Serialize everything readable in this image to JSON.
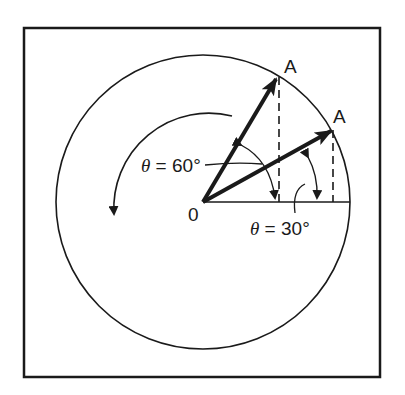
{
  "figure": {
    "origin_label": "0",
    "point_label_upper": "A",
    "point_label_lower": "A",
    "angle_label_60": {
      "symbol": "θ",
      "text": " = 60°"
    },
    "angle_label_30": {
      "symbol": "θ",
      "text": " = 30°"
    },
    "angles_deg": [
      60,
      30
    ],
    "rotation_direction": "counterclockwise",
    "colors": {
      "stroke": "#1a1a1a",
      "background": "#ffffff"
    }
  }
}
